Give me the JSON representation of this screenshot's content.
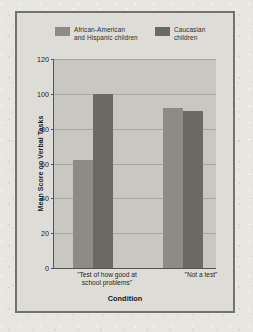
{
  "figure": {
    "frame_color": "#73736e",
    "plot_background": "#c9c7c1",
    "page_background": "#e8e6e0"
  },
  "chart_data": {
    "type": "bar",
    "title": "",
    "subtitle": "",
    "xlabel": "Condition",
    "ylabel": "Mean Score on Verbal Tasks",
    "categories": [
      "\"Test of how good at\nschool problems\"",
      "\"Not a test\""
    ],
    "series": [
      {
        "name": "African-American\nand Hispanic children",
        "color": "#8d8b85",
        "values": [
          62,
          92
        ]
      },
      {
        "name": "Caucasian\nchildren",
        "color": "#6b6964",
        "values": [
          100,
          90
        ]
      }
    ],
    "ylim": [
      0,
      120
    ],
    "yticks": [
      0,
      20,
      40,
      60,
      80,
      100,
      120
    ],
    "ytick_labels": [
      "0",
      "20",
      "40",
      "60",
      "80",
      "100",
      "120"
    ],
    "grid": true,
    "legend_position": "top"
  }
}
